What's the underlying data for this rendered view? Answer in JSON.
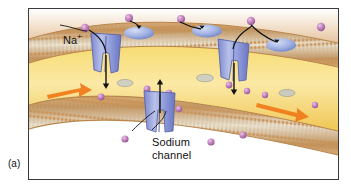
{
  "figure": {
    "panel_label": "(a)",
    "background_color": "#ffffff",
    "frame_color": "#3a3a3a"
  },
  "labels": {
    "na_ion": "Na",
    "na_charge": "+",
    "sodium_channel_line1": "Sodium",
    "sodium_channel_line2": "channel"
  },
  "colors": {
    "ion": "#b濃",
    "ion_fill": "#c77fc0",
    "ion_stroke": "#8e5a8c",
    "channel_fill": "#8f9ad8",
    "channel_stroke": "#5b66a8",
    "receptor_fill": "#9aaade",
    "membrane_band": "#cfa066",
    "membrane_core": "#e8dcc8",
    "cytoplasm": "#f2cf52",
    "cytoplasm_light": "#fbe9a8",
    "arrow_orange": "#f07818",
    "arrow_black": "#1a1a1a",
    "extracellular": "#e8cba8"
  },
  "diagram": {
    "type": "cell-membrane-schematic",
    "extracellular_ions": 5,
    "intracellular_ions": 8,
    "membrane_channels": 3,
    "surface_receptors": 3,
    "orange_flow_arrows": 2,
    "ion_entry_arrows": 3
  }
}
